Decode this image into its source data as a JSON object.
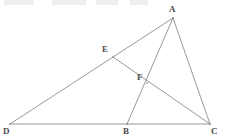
{
  "figure": {
    "type": "euclidean-geometry-diagram",
    "canvas": {
      "width": 226,
      "height": 139
    },
    "background_color": "#ffffff",
    "line_color": "#8c8c8c",
    "label_color": "#4a4a4a",
    "line_width": 0.9,
    "points": [
      {
        "id": "A",
        "label": "A",
        "x": 173,
        "y": 18,
        "label_x": 169,
        "label_y": 5,
        "on": "apex"
      },
      {
        "id": "E",
        "label": "E",
        "x": 113,
        "y": 57,
        "label_x": 102,
        "label_y": 45,
        "on": "segment-DA"
      },
      {
        "id": "F",
        "label": "F",
        "x": 147,
        "y": 83,
        "label_x": 137,
        "label_y": 73,
        "on": "intersection-EC-AB"
      },
      {
        "id": "D",
        "label": "D",
        "x": 10,
        "y": 124,
        "label_x": 3,
        "label_y": 127,
        "on": "base-line"
      },
      {
        "id": "B",
        "label": "B",
        "x": 127,
        "y": 124,
        "label_x": 123,
        "label_y": 127,
        "on": "base-line"
      },
      {
        "id": "C",
        "label": "C",
        "x": 210,
        "y": 124,
        "label_x": 211,
        "label_y": 127,
        "on": "base-line"
      }
    ],
    "segments": [
      {
        "id": "DC",
        "name": "base-line-d-c",
        "from": "D",
        "to": "C",
        "x1": 10,
        "y1": 124,
        "x2": 210,
        "y2": 124
      },
      {
        "id": "DA",
        "name": "segment-d-a",
        "from": "D",
        "to": "A",
        "x1": 10,
        "y1": 124,
        "x2": 173,
        "y2": 18
      },
      {
        "id": "AB",
        "name": "segment-a-b",
        "from": "A",
        "to": "B",
        "x1": 173,
        "y1": 18,
        "x2": 127,
        "y2": 124
      },
      {
        "id": "AC",
        "name": "segment-a-c",
        "from": "A",
        "to": "C",
        "x1": 173,
        "y1": 18,
        "x2": 210,
        "y2": 124
      },
      {
        "id": "EC",
        "name": "segment-e-c",
        "from": "E",
        "to": "C",
        "x1": 113,
        "y1": 57,
        "x2": 210,
        "y2": 124
      }
    ],
    "top_artifacts": [
      {
        "id": "artifact-1",
        "x": 4,
        "width": 30,
        "text": "·· ···"
      },
      {
        "id": "artifact-2",
        "x": 52,
        "width": 34,
        "text": "·····"
      },
      {
        "id": "artifact-3",
        "x": 96,
        "width": 22,
        "text": "···"
      },
      {
        "id": "artifact-4",
        "x": 130,
        "width": 18,
        "text": "··"
      }
    ]
  }
}
